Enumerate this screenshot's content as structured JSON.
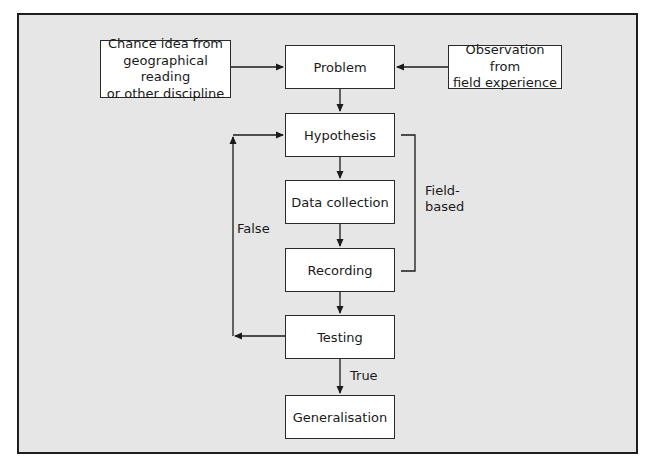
{
  "diagram": {
    "type": "flowchart",
    "colors": {
      "background": "#e6e6e6",
      "box_fill": "#ffffff",
      "stroke": "#1e1e1e"
    },
    "inputs": {
      "left": "Chance idea from geographical reading or other discipline",
      "left_lines": [
        "Chance idea from",
        "geographical reading",
        "or other discipline"
      ],
      "right": "Observation from field experience",
      "right_lines": [
        "Observation from",
        "field experience"
      ]
    },
    "steps": [
      "Problem",
      "Hypothesis",
      "Data collection",
      "Recording",
      "Testing",
      "Generalisation"
    ],
    "labels": {
      "false": "False",
      "true": "True",
      "bracket_line1": "Field-",
      "bracket_line2": "based"
    },
    "edges": [
      {
        "from": "Chance idea from geographical reading or other discipline",
        "to": "Problem"
      },
      {
        "from": "Observation from field experience",
        "to": "Problem"
      },
      {
        "from": "Problem",
        "to": "Hypothesis"
      },
      {
        "from": "Hypothesis",
        "to": "Data collection"
      },
      {
        "from": "Data collection",
        "to": "Recording"
      },
      {
        "from": "Recording",
        "to": "Testing"
      },
      {
        "from": "Testing",
        "to": "Hypothesis",
        "label": "False"
      },
      {
        "from": "Testing",
        "to": "Generalisation",
        "label": "True"
      }
    ],
    "bracket": {
      "spans": [
        "Hypothesis",
        "Data collection",
        "Recording"
      ],
      "label": "Field-based"
    }
  }
}
